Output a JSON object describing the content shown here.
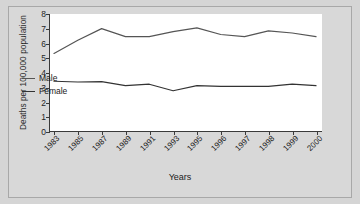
{
  "chart_data": {
    "type": "line",
    "title": "",
    "xlabel": "Years",
    "ylabel": "Deaths per 100,000 population",
    "categories": [
      "1983",
      "1985",
      "1987",
      "1989",
      "1991",
      "1993",
      "1995",
      "1996",
      "1997",
      "1998",
      "1999",
      "2000"
    ],
    "series": [
      {
        "name": "Male",
        "values": [
          5.3,
          6.2,
          7.0,
          6.45,
          6.45,
          6.8,
          7.05,
          6.6,
          6.45,
          6.85,
          6.7,
          6.45
        ],
        "color": "#555555"
      },
      {
        "name": "Female",
        "values": [
          3.4,
          3.35,
          3.38,
          3.1,
          3.2,
          2.75,
          3.1,
          3.05,
          3.05,
          3.05,
          3.2,
          3.1
        ],
        "color": "#333333"
      }
    ],
    "ylim": [
      0,
      8
    ],
    "yticks": [
      "0",
      "1",
      "2",
      "3",
      "4",
      "5",
      "6",
      "7",
      "8"
    ],
    "grid": false,
    "legend_position": "inside-left"
  },
  "legend": {
    "items": [
      {
        "label": "Male"
      },
      {
        "label": "Female"
      }
    ]
  },
  "colors": {
    "background": "#d5d5d5",
    "plot_background": "#ffffff",
    "axis": "#3a3a3a",
    "male_line": "#555555",
    "female_line": "#333333"
  }
}
